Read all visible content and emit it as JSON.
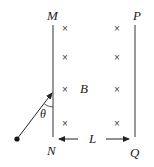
{
  "diagram": {
    "labels": {
      "M": "M",
      "N": "N",
      "P": "P",
      "Q": "Q",
      "field": "B",
      "distance": "L",
      "angle": "θ"
    },
    "field_symbol": "×",
    "field_rows": 4,
    "field_columns": 2,
    "colors": {
      "line": "#333333",
      "text": "#222222",
      "cross": "#444444"
    }
  }
}
